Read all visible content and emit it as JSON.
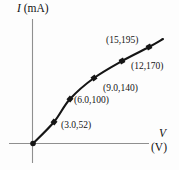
{
  "figure": {
    "background": "#fdfdfd",
    "axis_color": "#8f8f8f",
    "curve_color": "#151515",
    "text_color": "#141414"
  },
  "labels": {
    "y_var": "I",
    "y_unit": "(mA)",
    "x_var": "V",
    "x_unit": "(V)"
  },
  "chart_data": {
    "type": "line",
    "title": "",
    "xlabel": "V (V)",
    "ylabel": "I (mA)",
    "x": [
      0,
      3.0,
      6.0,
      9.0,
      12,
      15
    ],
    "y": [
      0,
      52,
      100,
      140,
      170,
      195
    ],
    "point_labels": [
      "",
      "(3.0,52)",
      "(6.0,100)",
      "(9.0,140)",
      "(12,170)",
      "(15,195)"
    ],
    "xlim": [
      0,
      17
    ],
    "ylim": [
      0,
      220
    ],
    "grid": false,
    "legend": false,
    "render": {
      "points_px": [
        [
          33,
          143.5
        ],
        [
          54,
          122
        ],
        [
          70,
          99
        ],
        [
          94,
          78
        ],
        [
          122,
          61
        ],
        [
          149,
          47
        ]
      ],
      "curve_end_px": [
        163,
        39
      ],
      "label_pos_px": [
        null,
        [
          61,
          121
        ],
        [
          74,
          96
        ],
        [
          103,
          84
        ],
        [
          131,
          62
        ],
        [
          106,
          36
        ]
      ],
      "axes": {
        "y_axis": {
          "x": 32.5,
          "y1": 19,
          "y2": 163
        },
        "x_axis": {
          "y": 143.5,
          "x1": 9,
          "x2": 149
        }
      },
      "marker_size": 5,
      "curve_width": 2.1
    }
  }
}
